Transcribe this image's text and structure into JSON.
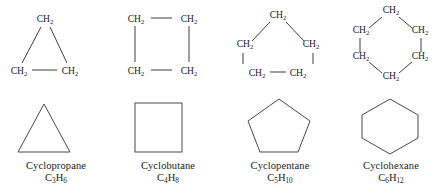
{
  "figure": {
    "background_color": "#ffffff",
    "line_color": "#3f3f42",
    "text_color": "#1a1a1a",
    "group_label": "CH",
    "group_subscript": "2"
  },
  "compounds": [
    {
      "name": "Cyclopropane",
      "formula_main": "C",
      "formula_sub1": "3",
      "formula_mid": "H",
      "formula_sub2": "6",
      "ring_size": 3,
      "shape": "triangle",
      "ch2_count": 3,
      "ch2_labels": [
        "CH2",
        "CH2",
        "CH2"
      ]
    },
    {
      "name": "Cyclobutane",
      "formula_main": "C",
      "formula_sub1": "4",
      "formula_mid": "H",
      "formula_sub2": "8",
      "ring_size": 4,
      "shape": "square",
      "ch2_count": 4,
      "ch2_labels": [
        "CH2",
        "CH2",
        "CH2",
        "CH2"
      ]
    },
    {
      "name": "Cyclopentane",
      "formula_main": "C",
      "formula_sub1": "5",
      "formula_mid": "H",
      "formula_sub2": "10",
      "ring_size": 5,
      "shape": "pentagon",
      "ch2_count": 5,
      "ch2_labels": [
        "CH2",
        "CH2",
        "CH2",
        "CH2",
        "CH2"
      ]
    },
    {
      "name": "Cyclohexane",
      "formula_main": "C",
      "formula_sub1": "6",
      "formula_mid": "H",
      "formula_sub2": "12",
      "ring_size": 6,
      "shape": "hexagon",
      "ch2_count": 6,
      "ch2_labels": [
        "CH2",
        "CH2",
        "CH2",
        "CH2",
        "CH2",
        "CH2"
      ]
    }
  ]
}
